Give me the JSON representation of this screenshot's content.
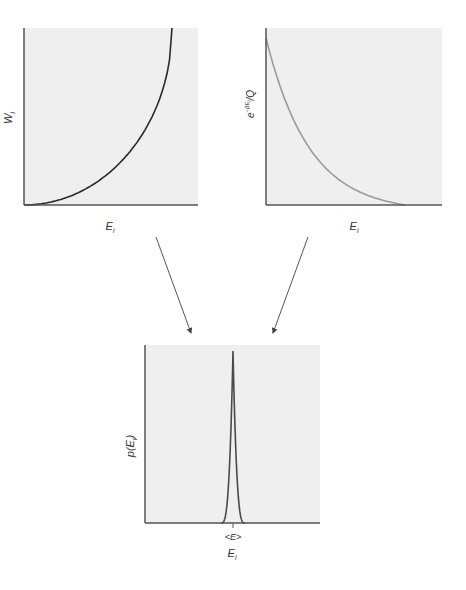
{
  "chart_data": [
    {
      "type": "line",
      "id": "degeneracy",
      "title": "",
      "xlabel": "E_i",
      "ylabel": "W_i",
      "description": "Number of states (degeneracy) increases steeply with energy",
      "series": [
        {
          "name": "W_i",
          "shape": "increasing-convex",
          "color": "#2a2a2a"
        }
      ],
      "grid": false
    },
    {
      "type": "line",
      "id": "boltzmann-factor",
      "title": "",
      "xlabel": "E_i",
      "ylabel": "e^{-βE_i}/Q",
      "description": "Boltzmann factor decays exponentially with energy",
      "series": [
        {
          "name": "e^{-βE_i}/Q",
          "shape": "decreasing-exponential",
          "color": "#9a9a9a"
        }
      ],
      "grid": false
    },
    {
      "type": "line",
      "id": "probability",
      "title": "",
      "xlabel": "E_i",
      "ylabel": "p(E_i)",
      "description": "Product gives a sharply peaked distribution at the mean energy",
      "x_tick_labels": [
        "<E>"
      ],
      "series": [
        {
          "name": "p(E_i)",
          "shape": "sharp-peak",
          "peak_at": "<E>",
          "color": "#4a4a4a"
        }
      ],
      "grid": false
    }
  ],
  "labels": {
    "top_left_x": "E",
    "top_left_x_sub": "i",
    "top_left_y": "W",
    "top_left_y_sub": "i",
    "top_right_x": "E",
    "top_right_x_sub": "i",
    "top_right_y_base": "e",
    "top_right_y_sup": "−βE",
    "top_right_y_sup_sub": "i",
    "top_right_y_tail": "/Q",
    "bottom_x": "E",
    "bottom_x_sub": "i",
    "bottom_y": "p(E",
    "bottom_y_sub": "i",
    "bottom_y_tail": ")",
    "bottom_tick": "<E>"
  },
  "colors": {
    "panel_bg": "#efefef",
    "axis": "#555555",
    "curve_dark": "#2a2a2a",
    "curve_light": "#9a9a9a",
    "curve_peak": "#4a4a4a",
    "arrow": "#555555"
  }
}
